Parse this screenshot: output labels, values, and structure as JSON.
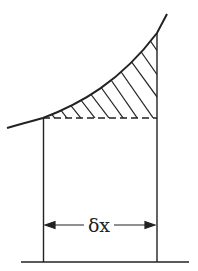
{
  "diagram": {
    "title": "",
    "width_label": "δx",
    "colors": {
      "stroke": "#222222",
      "background": "#ffffff"
    },
    "elements": {
      "curve": "increasing curve y = f(x)",
      "strip": "vertical strip of width δx under the curve",
      "hatched_region": "hatched area between curve and dashed horizontal line",
      "dashed_line": "horizontal dashed line at left strip height",
      "dimension_arrow": "double-headed arrow spanning strip width",
      "baseline": "x-axis baseline"
    }
  }
}
